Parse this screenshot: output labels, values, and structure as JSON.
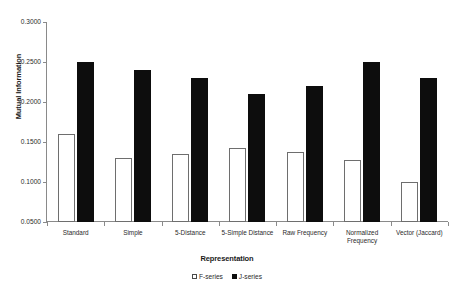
{
  "chart_data": {
    "type": "bar",
    "title": "",
    "xlabel": "Representation",
    "ylabel": "Mutual Information",
    "categories": [
      "Standard",
      "Simple",
      "5-Distance",
      "5-Simple Distance",
      "Raw Frequency",
      "Normalized Frequency",
      "Vector (Jaccard)"
    ],
    "series": [
      {
        "name": "F-series",
        "color": "#ffffff",
        "values": [
          0.16,
          0.13,
          0.135,
          0.142,
          0.138,
          0.128,
          0.1
        ]
      },
      {
        "name": "J-series",
        "color": "#0d0d0d",
        "values": [
          0.25,
          0.24,
          0.23,
          0.21,
          0.22,
          0.25,
          0.23
        ]
      }
    ],
    "ylim": [
      0.05,
      0.3
    ],
    "ytick_step": 0.05,
    "ytick_labels": [
      "0.0500",
      "0.1000",
      "0.1500",
      "0.2000",
      "0.2500",
      "0.3000"
    ],
    "ytick_values": [
      0.05,
      0.1,
      0.15,
      0.2,
      0.25,
      0.3
    ],
    "grid": false,
    "legend_position": "bottom"
  },
  "axes": {
    "y_title": "Mutual Information",
    "x_title": "Representation"
  },
  "legend": {
    "entries": [
      {
        "label": "F-series",
        "swatch": "hollow-square"
      },
      {
        "label": "J-series",
        "swatch": "filled-square"
      }
    ]
  }
}
